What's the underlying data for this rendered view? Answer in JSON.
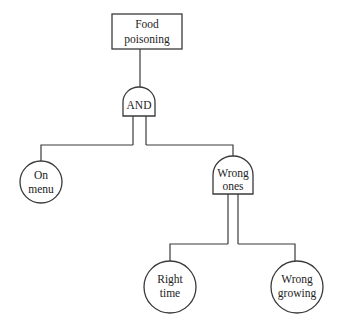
{
  "diagram": {
    "type": "fault-tree",
    "top_event": {
      "line1": "Food",
      "line2": "poisoning"
    },
    "gate_and": {
      "label": "AND"
    },
    "event_on_menu": {
      "line1": "On",
      "line2": "menu"
    },
    "gate_wrong_ones": {
      "line1": "Wrong",
      "line2": "ones"
    },
    "event_right_time": {
      "line1": "Right",
      "line2": "time"
    },
    "event_wrong_growing": {
      "line1": "Wrong",
      "line2": "growing"
    }
  },
  "colors": {
    "stroke": "#3a3a3a",
    "text": "#222222",
    "background": "#ffffff"
  }
}
